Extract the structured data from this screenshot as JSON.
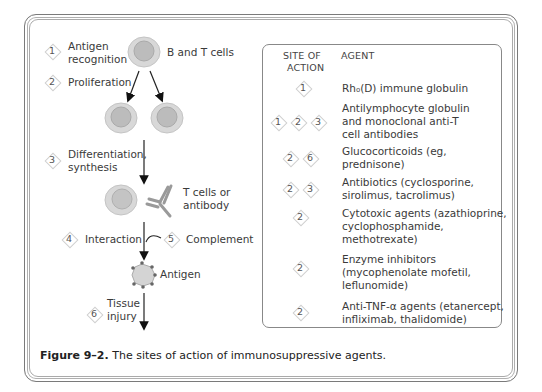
{
  "figure": {
    "caption_label": "Figure 9–2.",
    "caption_text": " The sites of action of immunosuppressive agents."
  },
  "diagram": {
    "steps": [
      {
        "number": "1",
        "label_lines": [
          "Antigen",
          "recognition"
        ]
      },
      {
        "number": "2",
        "label_lines": [
          "Proliferation"
        ]
      },
      {
        "number": "3",
        "label_lines": [
          "Differentiation,",
          "synthesis"
        ]
      },
      {
        "number": "4",
        "label_lines": [
          "Interaction"
        ]
      },
      {
        "number": "5",
        "label_lines": [
          "Complement"
        ]
      },
      {
        "number": "6",
        "label_lines": [
          "Tissue",
          "injury"
        ]
      }
    ],
    "labels": {
      "b_and_t_cells": "B and T cells",
      "t_cells_or_antibody_1": "T cells or",
      "t_cells_or_antibody_2": "antibody",
      "antigen": "Antigen"
    }
  },
  "table": {
    "header_site_1": "SITE OF",
    "header_site_2": "ACTION",
    "header_agent": "AGENT",
    "rows": [
      {
        "sites": [
          "1"
        ],
        "agent_lines": [
          "Rh₀(D) immune globulin"
        ]
      },
      {
        "sites": [
          "1",
          "2",
          "3"
        ],
        "agent_lines": [
          "Antilymphocyte globulin",
          "and monoclonal anti-T",
          "cell antibodies"
        ]
      },
      {
        "sites": [
          "2",
          "6"
        ],
        "agent_lines": [
          "Glucocorticoids (eg,",
          "prednisone)"
        ]
      },
      {
        "sites": [
          "2",
          "3"
        ],
        "agent_lines": [
          "Antibiotics (cyclosporine,",
          "sirolimus, tacrolimus)"
        ]
      },
      {
        "sites": [
          "2"
        ],
        "agent_lines": [
          "Cytotoxic agents (azathioprine,",
          "cyclophosphamide,",
          "methotrexate)"
        ]
      },
      {
        "sites": [
          "2"
        ],
        "agent_lines": [
          "Enzyme inhibitors",
          "(mycophenolate mofetil,",
          "leflunomide)"
        ]
      },
      {
        "sites": [
          "2"
        ],
        "agent_lines": [
          "Anti-TNF-α agents (etanercept,",
          "  infliximab, thalidomide)"
        ]
      }
    ]
  },
  "colors": {
    "cell_outer": "#d6d6d6",
    "cell_inner": "#bdbdbd",
    "border": "#888888",
    "text": "#3a3a3a"
  }
}
